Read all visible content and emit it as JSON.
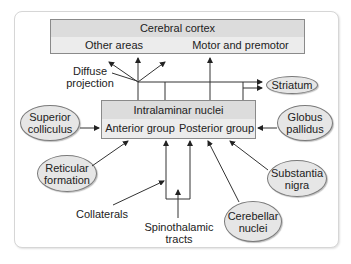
{
  "diagram": {
    "cortex": {
      "title": "Cerebral cortex",
      "left": "Other areas",
      "right": "Motor and premotor"
    },
    "thalamus": {
      "title": "Intralaminar nuclei",
      "left": "Anterior group",
      "right": "Posterior group"
    },
    "inputs": {
      "superior_colliculus": "Superior colliculus",
      "reticular_formation": "Reticular formation",
      "globus_pallidus": "Globus pallidus",
      "substantia_nigra": "Substantia nigra",
      "cerebellar_nuclei": "Cerebellar nuclei"
    },
    "outputs": {
      "striatum": "Striatum"
    },
    "labels": {
      "diffuse_projection": "Diffuse projection",
      "collaterals": "Collaterals",
      "spinothalamic_tracts": "Spinothalamic tracts"
    },
    "colors": {
      "box_fill": "#e9e9e9",
      "header_fill": "#dcdcdc",
      "ellipse_fill": "#e6e6e6",
      "line": "#333333"
    }
  }
}
